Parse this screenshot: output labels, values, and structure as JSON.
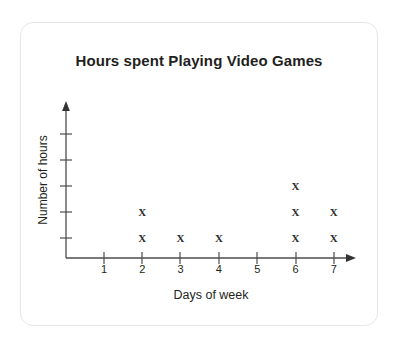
{
  "card": {
    "border_color": "#e6e7e9"
  },
  "chart_data": {
    "type": "scatter",
    "plot_style": "dot-plot",
    "title": "Hours spent Playing Video Games",
    "xlabel": "Days of week",
    "ylabel": "Number of hours",
    "categories": [
      "1",
      "2",
      "3",
      "4",
      "5",
      "6",
      "7"
    ],
    "values": [
      0,
      2,
      1,
      1,
      0,
      3,
      2
    ],
    "marker_symbol": "X",
    "marker_color": "#2b2b2b",
    "axis_color": "#4d4d4d",
    "xlim": [
      0.5,
      7.6
    ],
    "ylim": [
      0,
      5
    ],
    "yticks": [
      1,
      2,
      3,
      4,
      5
    ],
    "ytick_labels": [
      "",
      "",
      "",
      "",
      ""
    ],
    "grid": false,
    "legend": false,
    "points": [
      {
        "x": 2,
        "y": 1
      },
      {
        "x": 2,
        "y": 2
      },
      {
        "x": 3,
        "y": 1
      },
      {
        "x": 4,
        "y": 1
      },
      {
        "x": 6,
        "y": 1
      },
      {
        "x": 6,
        "y": 2
      },
      {
        "x": 6,
        "y": 3
      },
      {
        "x": 7,
        "y": 1
      },
      {
        "x": 7,
        "y": 2
      }
    ]
  }
}
